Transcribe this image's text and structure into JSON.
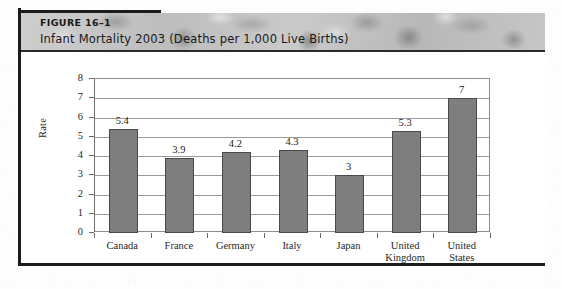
{
  "figure": {
    "number_label": "FIGURE 16–1",
    "title": "Infant Mortality 2003 (Deaths per 1,000 Live Births)"
  },
  "colors": {
    "bar_fill": "#7e7e7e",
    "bar_border": "#4a4a4a",
    "banner_bg": "#c4c4c4",
    "frame": "#1c1c1c",
    "text": "#1c1c1c"
  },
  "chart_data": {
    "type": "bar",
    "title": "Infant Mortality 2003 (Deaths per 1,000 Live Births)",
    "categories": [
      "Canada",
      "France",
      "Germany",
      "Italy",
      "Japan",
      "United\nKingdom",
      "United\nStates"
    ],
    "values": [
      5.4,
      3.9,
      4.2,
      4.3,
      3,
      5.3,
      7
    ],
    "value_labels": [
      "5.4",
      "3.9",
      "4.2",
      "4.3",
      "3",
      "5.3",
      "7"
    ],
    "xlabel": "",
    "ylabel": "Rate",
    "ylim": [
      0,
      8
    ],
    "yticks": [
      0,
      1,
      2,
      3,
      4,
      5,
      6,
      7,
      8
    ],
    "ytick_labels": [
      "0",
      "1",
      "2",
      "3",
      "4",
      "5",
      "6",
      "7",
      "8"
    ],
    "grid": true,
    "legend": false
  }
}
